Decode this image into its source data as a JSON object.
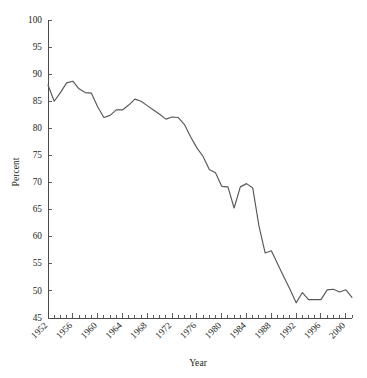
{
  "chart_data": {
    "type": "line",
    "title": "",
    "xlabel": "Year",
    "ylabel": "Percent",
    "xlim": [
      1952,
      2001
    ],
    "ylim": [
      45,
      100
    ],
    "ytick_step": 5,
    "xtick_label_step": 4,
    "xtick_minor_step": 1,
    "grid": false,
    "legend": false,
    "line_color": "#58585a",
    "axis_color": "#4a4a4a",
    "background": "#ffffff",
    "yticks": [
      45,
      50,
      55,
      60,
      65,
      70,
      75,
      80,
      85,
      90,
      95,
      100
    ],
    "ytick_labels": [
      "45",
      "50",
      "55",
      "60",
      "65",
      "70",
      "75",
      "80",
      "85",
      "90",
      "95",
      "100"
    ],
    "xticks": [
      1952,
      1956,
      1960,
      1964,
      1968,
      1972,
      1976,
      1980,
      1984,
      1988,
      1992,
      1996,
      2000
    ],
    "xtick_labels": [
      "1952",
      "1956",
      "1960",
      "1964",
      "1968",
      "1972",
      "1976",
      "1980",
      "1984",
      "1988",
      "1992",
      "1996",
      "2000"
    ],
    "x": [
      1952,
      1953,
      1954,
      1955,
      1956,
      1957,
      1958,
      1959,
      1960,
      1961,
      1962,
      1963,
      1964,
      1965,
      1966,
      1967,
      1968,
      1969,
      1970,
      1971,
      1972,
      1973,
      1974,
      1975,
      1976,
      1977,
      1978,
      1979,
      1980,
      1981,
      1982,
      1983,
      1984,
      1985,
      1986,
      1987,
      1988,
      1989,
      1990,
      1991,
      1992,
      1993,
      1994,
      1995,
      1996,
      1997,
      1998,
      1999,
      2000,
      2001
    ],
    "values": [
      88.0,
      85.0,
      86.6,
      88.4,
      88.7,
      87.3,
      86.6,
      86.5,
      84.0,
      82.0,
      82.4,
      83.4,
      83.4,
      84.3,
      85.4,
      85.0,
      84.2,
      83.4,
      82.6,
      81.7,
      82.1,
      82.0,
      80.7,
      78.4,
      76.4,
      74.8,
      72.4,
      71.8,
      69.3,
      69.2,
      65.3,
      69.2,
      69.8,
      69.0,
      62.0,
      57.0,
      57.4,
      55.0,
      52.6,
      50.3,
      47.8,
      49.7,
      48.4,
      48.4,
      48.4,
      50.2,
      50.3,
      49.8,
      50.2,
      48.8
    ],
    "series_name": "Percent"
  }
}
